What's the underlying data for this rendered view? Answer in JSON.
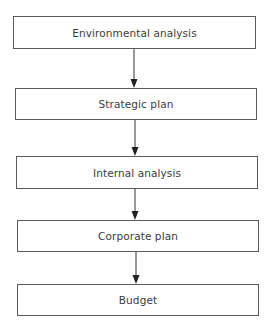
{
  "diagram": {
    "type": "flowchart",
    "direction": "top-to-bottom",
    "nodes": [
      {
        "id": "environmental-analysis",
        "label": "Environmental analysis"
      },
      {
        "id": "strategic-plan",
        "label": "Strategic plan"
      },
      {
        "id": "internal-analysis",
        "label": "Internal analysis"
      },
      {
        "id": "corporate-plan",
        "label": "Corporate plan"
      },
      {
        "id": "budget",
        "label": "Budget"
      }
    ],
    "edges": [
      {
        "from": "environmental-analysis",
        "to": "strategic-plan"
      },
      {
        "from": "strategic-plan",
        "to": "internal-analysis"
      },
      {
        "from": "internal-analysis",
        "to": "corporate-plan"
      },
      {
        "from": "corporate-plan",
        "to": "budget"
      }
    ],
    "colors": {
      "border": "#5a5a5a",
      "text": "#3c3c3c",
      "arrow": "#222222",
      "background": "#ffffff"
    }
  }
}
